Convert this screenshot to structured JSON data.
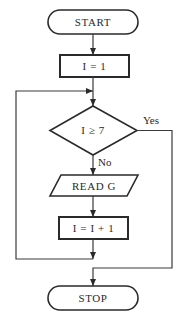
{
  "flowchart": {
    "nodes": {
      "start": {
        "type": "terminal",
        "text": "START"
      },
      "init": {
        "type": "process",
        "text": "I = 1"
      },
      "decision": {
        "type": "decision",
        "text": "I ≥ 7"
      },
      "read": {
        "type": "io",
        "text": "READ G"
      },
      "increment": {
        "type": "process",
        "text": "I = I + 1"
      },
      "stop": {
        "type": "terminal",
        "text": "STOP"
      }
    },
    "edges": {
      "yes_label": "Yes",
      "no_label": "No"
    },
    "colors": {
      "stroke": "#2a2a2a",
      "background": "#ffffff"
    }
  }
}
